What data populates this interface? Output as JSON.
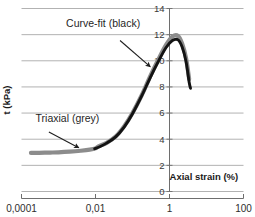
{
  "chart_data": {
    "type": "line",
    "title": "",
    "xlabel": "Axial strain (%)",
    "ylabel": "t (kPa)",
    "xscale": "log",
    "xlim": [
      0.0001,
      100
    ],
    "ylim": [
      0,
      14
    ],
    "xticks": [
      "0,0001",
      "0,01",
      "1",
      "100"
    ],
    "xtick_values": [
      0.0001,
      0.01,
      1,
      100
    ],
    "yticks": [
      "0",
      "2",
      "4",
      "6",
      "8",
      "10",
      "12",
      "14"
    ],
    "ytick_values": [
      0,
      2,
      4,
      6,
      8,
      10,
      12,
      14
    ],
    "grid": "horizontal",
    "legend_position": "inline-annotations",
    "series": [
      {
        "name": "Triaxial (grey)",
        "color": "#8c8c8c",
        "points": [
          [
            0.00018,
            2.95
          ],
          [
            0.0003,
            2.96
          ],
          [
            0.0006,
            2.98
          ],
          [
            0.001,
            3.0
          ],
          [
            0.002,
            3.05
          ],
          [
            0.004,
            3.12
          ],
          [
            0.007,
            3.2
          ],
          [
            0.01,
            3.3
          ],
          [
            0.012,
            3.45
          ],
          [
            0.02,
            3.72
          ],
          [
            0.035,
            4.2
          ],
          [
            0.06,
            5.0
          ],
          [
            0.1,
            6.0
          ],
          [
            0.18,
            7.4
          ],
          [
            0.3,
            8.8
          ],
          [
            0.5,
            10.1
          ],
          [
            0.8,
            11.2
          ],
          [
            1.2,
            11.85
          ],
          [
            1.7,
            11.9
          ],
          [
            2.2,
            11.3
          ],
          [
            2.8,
            10.2
          ],
          [
            3.4,
            8.6
          ]
        ]
      },
      {
        "name": "Curve-fit (black)",
        "color": "#131313",
        "points": [
          [
            0.0095,
            3.28
          ],
          [
            0.013,
            3.42
          ],
          [
            0.02,
            3.7
          ],
          [
            0.035,
            4.18
          ],
          [
            0.06,
            4.95
          ],
          [
            0.1,
            5.95
          ],
          [
            0.18,
            7.35
          ],
          [
            0.3,
            8.7
          ],
          [
            0.5,
            9.95
          ],
          [
            0.8,
            11.0
          ],
          [
            1.2,
            11.55
          ],
          [
            1.7,
            11.6
          ],
          [
            2.2,
            11.05
          ],
          [
            2.8,
            9.95
          ],
          [
            3.4,
            8.35
          ],
          [
            3.7,
            7.9
          ]
        ]
      }
    ],
    "annotations": [
      {
        "text": "Curve-fit (black)",
        "label_x": 0.0016,
        "label_y": 12.55,
        "arrow_from_x": 0.046,
        "arrow_from_y": 11.55,
        "arrow_to_x": 0.3,
        "arrow_to_y": 9.55
      },
      {
        "text": "Triaxial (grey)",
        "label_x": 0.00024,
        "label_y": 5.35,
        "arrow_from_x": 0.00055,
        "arrow_from_y": 4.55,
        "arrow_to_x": 0.0035,
        "arrow_to_y": 3.35
      }
    ],
    "colors": {
      "grid": "#a9a9a9",
      "axis": "#6e6e6e",
      "triaxial": "#8c8c8c",
      "curve_fit": "#131313",
      "text": "#1f1f1f",
      "background": "#ffffff"
    }
  }
}
